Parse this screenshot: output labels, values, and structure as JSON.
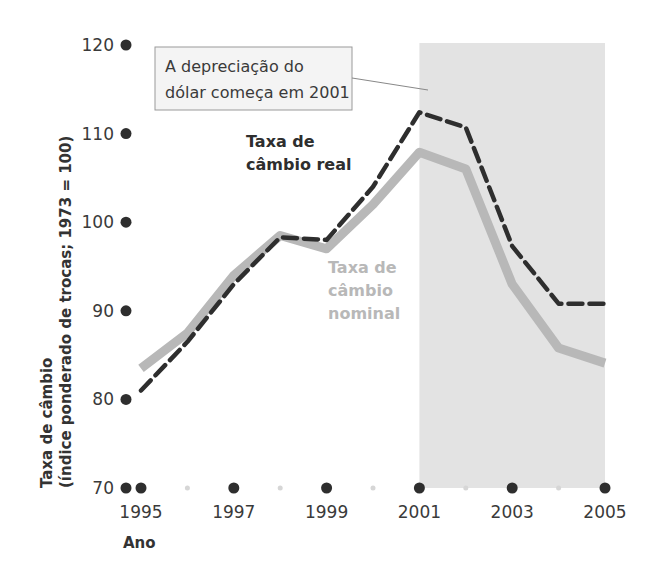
{
  "chart_data": {
    "type": "line",
    "title": "",
    "xlabel": "Ano",
    "ylabel_line1": "Taxa de câmbio",
    "ylabel_line2": "(índice ponderado de trocas; 1973 = 100)",
    "ylim": [
      70,
      120
    ],
    "xlim": [
      1995,
      2005
    ],
    "y_ticks": [
      70,
      80,
      90,
      100,
      110,
      120
    ],
    "x_ticks": [
      1995,
      1997,
      1999,
      2001,
      2003,
      2005
    ],
    "x_minor_ticks": [
      1996,
      1998,
      2000,
      2002,
      2004
    ],
    "grid": false,
    "legend": "inline labels",
    "x": [
      1995,
      1996,
      1997,
      1998,
      1999,
      2000,
      2001,
      2002,
      2003,
      2004,
      2005
    ],
    "series": [
      {
        "name": "Taxa de câmbio real",
        "label_line1": "Taxa de",
        "label_line2": "câmbio real",
        "style": "dashed",
        "color": "#2e2e2e",
        "values": [
          81.0,
          86.5,
          93.0,
          98.3,
          98.0,
          104.0,
          112.4,
          110.7,
          97.3,
          90.8,
          90.8
        ]
      },
      {
        "name": "Taxa de câmbio nominal",
        "label_line1": "Taxa de",
        "label_line2": "câmbio",
        "label_line3": "nominal",
        "style": "solid",
        "color": "#b8b8b8",
        "values": [
          83.5,
          87.5,
          94.0,
          98.5,
          97.0,
          102.0,
          107.9,
          106.0,
          93.0,
          85.8,
          84.1
        ]
      }
    ],
    "shaded_region": {
      "x_start": 2001,
      "x_end": 2005,
      "color": "#e3e3e3"
    },
    "annotations": [
      {
        "line1": "A depreciação do",
        "line2": "dólar começa em 2001",
        "points_to_year": 2001
      }
    ]
  }
}
